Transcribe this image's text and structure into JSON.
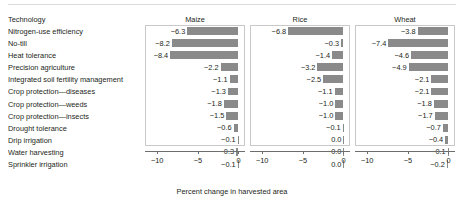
{
  "figure": {
    "row_header_label": "Technology",
    "axis_title": "Percent change in harvested area",
    "bar_color": "#8a8a8a",
    "axis_color": "#6d6d6d",
    "panel_border_color": "#c9c9c9"
  },
  "chart_data": {
    "type": "bar",
    "title": "",
    "subtitle": "",
    "xlabel": "Percent change in harvested area",
    "ylabel": "Technology",
    "orientation": "horizontal",
    "grid": false,
    "legend": "none",
    "xlim": [
      -11.5,
      0.8
    ],
    "xticks": [
      -10,
      -5,
      0
    ],
    "xtick_labels": [
      "−10",
      "−5",
      "0"
    ],
    "panels": [
      "Maize",
      "Rice",
      "Wheat"
    ],
    "categories": [
      "Nitrogen-use efficiency",
      "No-till",
      "Heat tolerance",
      "Precision agriculture",
      "Integrated soil fertility management",
      "Crop protection—diseases",
      "Crop protection—weeds",
      "Crop protection—insects",
      "Drought tolerance",
      "Drip irrigation",
      "Water harvesting",
      "Sprinkler irrigation"
    ],
    "series": [
      {
        "name": "Maize",
        "values": [
          -6.3,
          -8.2,
          -8.4,
          -2.2,
          -1.1,
          -1.3,
          -1.8,
          -1.5,
          -0.6,
          -0.1,
          -0.3,
          -0.1
        ],
        "labels": [
          "−6.3",
          "−8.2",
          "−8.4",
          "−2.2",
          "−1.1",
          "−1.3",
          "−1.8",
          "−1.5",
          "−0.6",
          "−0.1",
          "−0.3",
          "−0.1"
        ]
      },
      {
        "name": "Rice",
        "values": [
          -6.8,
          -0.3,
          -1.4,
          -3.2,
          -2.5,
          -1.1,
          -1.0,
          -1.0,
          -0.1,
          0.0,
          0.0,
          0.0
        ],
        "labels": [
          "−6.8",
          "−0.3",
          "−1.4",
          "−3.2",
          "−2.5",
          "−1.1",
          "−1.0",
          "−1.0",
          "−0.1",
          "0.0",
          "0.0",
          "0.0"
        ]
      },
      {
        "name": "Wheat",
        "values": [
          -3.8,
          -7.4,
          -4.6,
          -4.9,
          -2.1,
          -2.1,
          -1.8,
          -1.7,
          -0.7,
          -0.4,
          -0.1,
          -0.2
        ],
        "labels": [
          "−3.8",
          "−7.4",
          "−4.6",
          "−4.9",
          "−2.1",
          "−2.1",
          "−1.8",
          "−1.7",
          "−0.7",
          "−0.4",
          "−0.1",
          "−0.2"
        ]
      }
    ]
  }
}
